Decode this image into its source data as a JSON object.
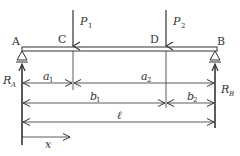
{
  "diagram": {
    "type": "simply-supported-beam",
    "colors": {
      "line": "#333333",
      "background": "#ffffff"
    },
    "points": {
      "A": "A",
      "B": "B",
      "C": "C",
      "D": "D"
    },
    "loads": [
      {
        "name": "P",
        "sub": "1",
        "at": "C"
      },
      {
        "name": "P",
        "sub": "2",
        "at": "D"
      }
    ],
    "reactions": [
      {
        "name": "R",
        "sub": "A",
        "at": "A"
      },
      {
        "name": "R",
        "sub": "B",
        "at": "B"
      }
    ],
    "dimensions": {
      "a1": {
        "name": "a",
        "sub": "1",
        "from": "A",
        "to": "C"
      },
      "a2": {
        "name": "a",
        "sub": "2",
        "from": "C",
        "to": "B"
      },
      "b1": {
        "name": "b",
        "sub": "1",
        "from": "A",
        "to": "D"
      },
      "b2": {
        "name": "b",
        "sub": "2",
        "from": "D",
        "to": "B"
      },
      "l": {
        "name": "ℓ",
        "from": "A",
        "to": "B"
      },
      "x": {
        "name": "x",
        "from": "A"
      }
    }
  }
}
